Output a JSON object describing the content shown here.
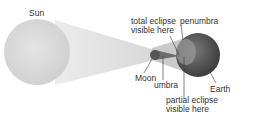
{
  "diagram": {
    "labels": {
      "sun": "Sun",
      "total_eclipse_line1": "total eclipse",
      "total_eclipse_line2": "visible here",
      "penumbra": "penumbra",
      "moon": "Moon",
      "umbra": "umbra",
      "earth": "Earth",
      "partial_eclipse_line1": "partial eclipse",
      "partial_eclipse_line2": "visible here"
    },
    "colors": {
      "sun": "#d9d9d9",
      "shadow_cone": "#e6e6e6",
      "penumbra": "#c8c8c8",
      "umbra": "#8a8a8a",
      "moon": "#5a5a5a",
      "earth": "#4a4a4a",
      "text": "#333333"
    }
  }
}
